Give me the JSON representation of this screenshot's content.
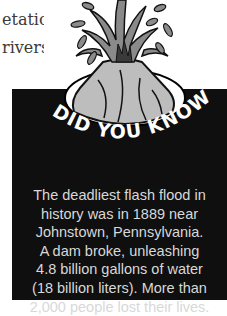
{
  "page_text": {
    "lines": [
      "etation",
      "rivers"
    ]
  },
  "sidebar_box": {
    "heading": "DID YOU KNOW?",
    "lines": [
      "The deadliest flash flood in",
      "history was in 1889 near",
      "Johnstown, Pennsylvania.",
      "A dam broke, unleashing",
      "4.8 billion gallons of water",
      "(18 billion liters). More than",
      "2,000 people lost their lives."
    ],
    "background_color": "#0f0f0f",
    "text_color": "#d8d8d8"
  },
  "illustration": {
    "icon": "erupting-volcano-icon"
  }
}
